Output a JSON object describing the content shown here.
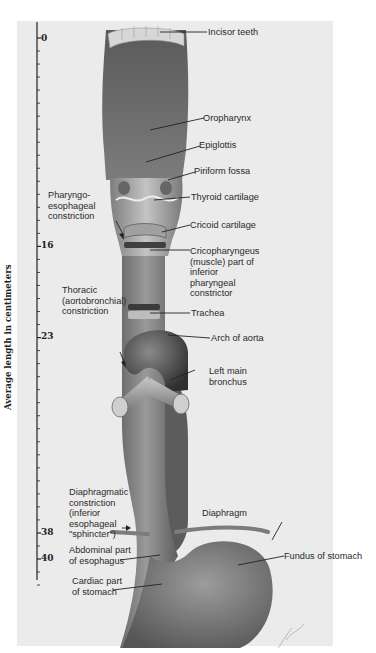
{
  "figure": {
    "type": "anatomical-illustration"
  },
  "scale": {
    "axis_title": "Average length in centimeters",
    "unit": "cm",
    "labeled_ticks": [
      "0",
      "16",
      "23",
      "38",
      "40"
    ],
    "tick_values": [
      0,
      16,
      23,
      38,
      40
    ]
  },
  "labels_right": {
    "incisor_teeth": "Incisor teeth",
    "oropharynx": "Oropharynx",
    "epiglottis": "Epiglottis",
    "piriform_fossa": "Piriform fossa",
    "thyroid_cartilage": "Thyroid cartilage",
    "cricoid_cartilage": "Cricoid cartilage",
    "cricopharyngeus": "Cricopharyngeus\n(muscle) part of\ninferior\npharyngeal\nconstrictor",
    "trachea": "Trachea",
    "arch_of_aorta": "Arch of aorta",
    "left_main_bronchus": "Left main\nbronchus",
    "diaphragm": "Diaphragm",
    "fundus_of_stomach": "Fundus of stomach"
  },
  "labels_left": {
    "pharyngoesophageal": "Pharyngo-\nesophageal\nconstriction",
    "thoracic": "Thoracic\n(aortobronchial)\nconstriction",
    "diaphragmatic": "Diaphragmatic\nconstriction\n(inferior\nesophageal\n\"sphincter\")",
    "abdominal_part": "Abdominal part\nof esophagus",
    "cardiac_part": "Cardiac part\nof stomach"
  },
  "colors": {
    "background": "#ebebeb",
    "tissue_dark": "#6e6e6e",
    "tissue_mid": "#8c8c8c",
    "tissue_light": "#b9b9b9",
    "text": "#2a2a2a"
  }
}
